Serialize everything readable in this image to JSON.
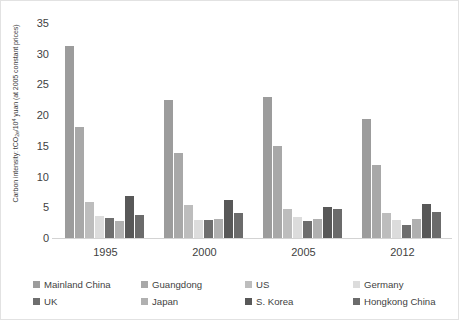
{
  "chart_data": {
    "type": "bar",
    "title": "",
    "xlabel": "",
    "ylabel": "Carbon intensity: tCO2e/10⁴ yuan (at 2005 constant prices)",
    "ylabel_parts": {
      "pre": "Carbon intensity: tCO",
      "sub": "2e",
      "mid": "/10",
      "sup": "4",
      "post": " yuan (at 2005 constant prices)"
    },
    "categories": [
      "1995",
      "2000",
      "2005",
      "2012"
    ],
    "ylim": [
      0,
      35
    ],
    "yticks": [
      35,
      30,
      25,
      20,
      15,
      10,
      5,
      0
    ],
    "grid": false,
    "legend_position": "bottom",
    "series": [
      {
        "name": "Mainland China",
        "color": "#9c9c9c",
        "values": [
          31.2,
          22.4,
          22.9,
          19.3
        ]
      },
      {
        "name": "Guangdong",
        "color": "#a8a8a8",
        "values": [
          18.1,
          13.8,
          14.9,
          11.9
        ]
      },
      {
        "name": "US",
        "color": "#bdbdbd",
        "values": [
          5.8,
          5.3,
          4.8,
          4.1
        ]
      },
      {
        "name": "Germany",
        "color": "#dcdcdc",
        "values": [
          3.6,
          3.0,
          3.4,
          2.9
        ]
      },
      {
        "name": "UK",
        "color": "#6e6e6e",
        "values": [
          3.3,
          3.0,
          2.8,
          2.2
        ]
      },
      {
        "name": "Japan",
        "color": "#b0b0b0",
        "values": [
          2.8,
          3.1,
          3.1,
          3.1
        ]
      },
      {
        "name": "S. Korea",
        "color": "#585858",
        "values": [
          6.9,
          6.2,
          5.1,
          5.6
        ]
      },
      {
        "name": "Hongkong China",
        "color": "#6b6b6b",
        "values": [
          3.7,
          4.0,
          4.8,
          4.2
        ]
      }
    ]
  }
}
